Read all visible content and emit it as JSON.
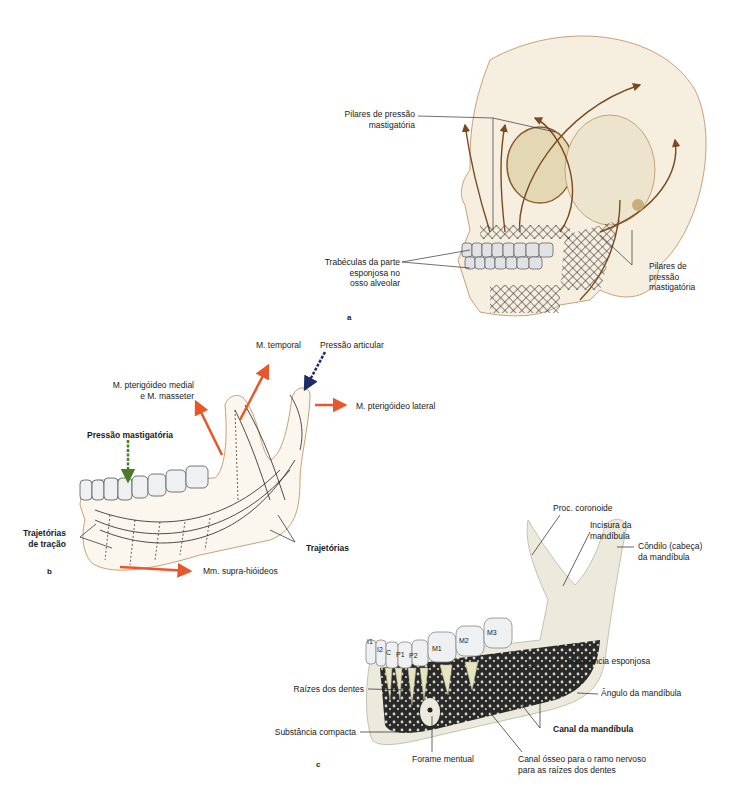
{
  "figure": {
    "panels": [
      {
        "letter": "a",
        "subject": "skull-lateral-view",
        "labels": {
          "pilares_top": [
            "Pilares de pressão",
            "mastigatória"
          ],
          "trabeculas": [
            "Trabéculas da parte",
            "esponjosa no",
            "osso alveolar"
          ],
          "pilares_right": [
            "Pilares de",
            "pressão",
            "mastigatória"
          ]
        }
      },
      {
        "letter": "b",
        "subject": "mandible-trajectories",
        "labels": {
          "temporal": "M. temporal",
          "pressao_articular": "Pressão articular",
          "pterigoideo_medial": [
            "M. pterigóideo medial",
            "e M. masseter"
          ],
          "pterigoideo_lateral": "M. pterigóideo lateral",
          "pressao_mastigatoria": "Pressão mastigatória",
          "trajetorias": "Trajetórias",
          "trajetorias_tracao": [
            "Trajetórias",
            "de tração"
          ],
          "supra_hioideos": "Mm. supra-hióideos"
        },
        "arrow_colors": {
          "muscle": "#e8572a",
          "articular": "#1f2a6b",
          "masticatory": "#4a7a2a"
        }
      },
      {
        "letter": "c",
        "subject": "mandible-cross-section",
        "teeth": [
          "I1",
          "I2",
          "C",
          "P1",
          "P2",
          "M1",
          "M2",
          "M3"
        ],
        "labels": {
          "coronoide": "Proc. coronoide",
          "incisura": [
            "Incisura da",
            "mandíbula"
          ],
          "condilo": [
            "Côndilo (cabeça)",
            "da mandíbula"
          ],
          "esponjosa": "Substância esponjosa",
          "angulo": "Ângulo da mandíbula",
          "raizes": "Raízes dos dentes",
          "canal_mandibula": "Canal da mandíbula",
          "compacta": "Substância compacta",
          "forame": "Forame mentual",
          "canal_osseo": [
            "Canal ósseo para o ramo nervoso",
            "para as raízes dos dentes"
          ]
        }
      }
    ]
  }
}
